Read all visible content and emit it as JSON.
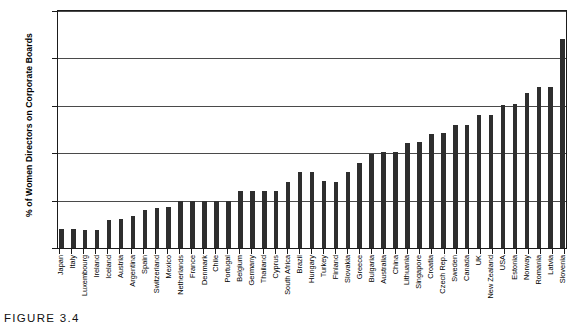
{
  "caption": "FIGURE 3.4",
  "chart_data": {
    "type": "bar",
    "title": "",
    "subtitle": "",
    "xlabel": "",
    "ylabel": "% of Women Directors on Corporate Boards",
    "ylim": [
      0,
      25
    ],
    "yticks": [
      0,
      5,
      10,
      15,
      20,
      25
    ],
    "ytick_labels": [
      "0",
      "5",
      "10",
      "15",
      "20",
      "25"
    ],
    "grid": "horizontal",
    "legend": "none",
    "bar_color": "#2e2e2e",
    "categories": [
      "Japan",
      "Italy",
      "Luxembourg",
      "Ireland",
      "Iceland",
      "Austria",
      "Argentina",
      "Spain",
      "Switzerland",
      "Mexico",
      "Netherlands",
      "France",
      "Denmark",
      "Chile",
      "Portugal",
      "Belgium",
      "Germany",
      "Thailand",
      "Cyprus",
      "South Africa",
      "Brazil",
      "Hungary",
      "Turkey",
      "Finland",
      "Slovakia",
      "Greece",
      "Bulgaria",
      "Australia",
      "China",
      "Lithuania",
      "Singapore",
      "Croatia",
      "Czech Rep.",
      "Sweden",
      "Canada",
      "UK",
      "New Zealand",
      "USA",
      "Estonia",
      "Norway",
      "Romania",
      "Latvia",
      "Slovenia"
    ],
    "values": [
      2.0,
      2.0,
      1.9,
      1.9,
      3.0,
      3.1,
      3.4,
      4.0,
      4.2,
      4.3,
      5.0,
      5.0,
      5.0,
      5.0,
      5.0,
      6.0,
      6.0,
      6.0,
      6.0,
      7.0,
      8.0,
      8.0,
      7.1,
      7.0,
      8.0,
      9.0,
      9.9,
      10.1,
      10.1,
      11.1,
      11.2,
      12.0,
      12.1,
      13.0,
      13.0,
      14.0,
      14.0,
      15.1,
      15.2,
      16.3,
      17.0,
      17.0,
      22.0
    ],
    "units": "percent",
    "max_value": 22.0,
    "min_value": 1.9
  },
  "ghost_text": {
    "line1": "Leading While Staring at Glass",
    "line2": "Violence"
  }
}
